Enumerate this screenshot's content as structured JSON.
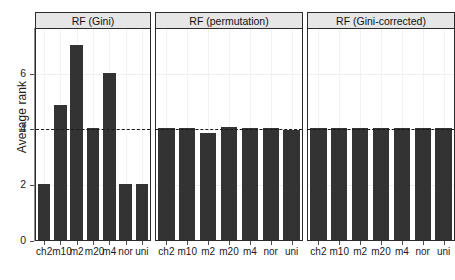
{
  "chart_data": {
    "type": "bar",
    "title": "",
    "xlabel": "",
    "ylabel": "Average rank",
    "ylim": [
      0,
      7.6
    ],
    "yticks": [
      0,
      2,
      4,
      6
    ],
    "ytick_labels": [
      "0",
      "2",
      "4",
      "6"
    ],
    "grid": true,
    "legend": "none",
    "reference_line": {
      "y": 4,
      "style": "dashed",
      "color": "#1a1a1a"
    },
    "bar_color": "#333333",
    "categories": [
      "ch2",
      "m10",
      "m2",
      "m20",
      "m4",
      "nor",
      "uni"
    ],
    "panels": [
      {
        "label": "RF (Gini)",
        "values": [
          2.0,
          4.85,
          7.0,
          4.0,
          6.0,
          2.0,
          2.0
        ]
      },
      {
        "label": "RF (permutation)",
        "values": [
          4.0,
          4.0,
          3.85,
          4.05,
          4.0,
          4.0,
          3.95
        ]
      },
      {
        "label": "RF (Gini-corrected)",
        "values": [
          4.0,
          4.0,
          4.0,
          4.0,
          4.0,
          4.0,
          4.0
        ]
      }
    ]
  },
  "axis": {
    "y_title": "Average rank"
  }
}
